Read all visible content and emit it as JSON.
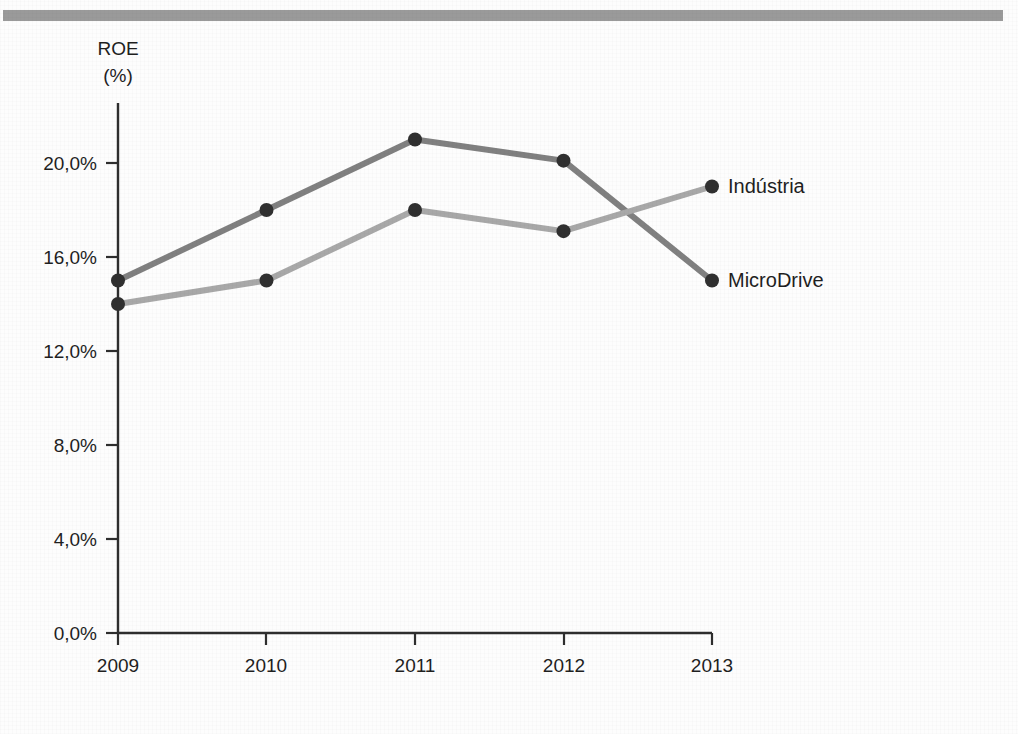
{
  "top_bar": {
    "color": "#9a9a9a"
  },
  "axis_title": {
    "line1": "ROE",
    "line2": "(%)"
  },
  "chart_data": {
    "type": "line",
    "title": "",
    "subtitle": "",
    "xlabel": "",
    "ylabel": "ROE (%)",
    "categories": [
      "2009",
      "2010",
      "2011",
      "2012",
      "2013"
    ],
    "x": [
      2009,
      2010,
      2011,
      2012,
      2013
    ],
    "ytick_labels": [
      "0,0%",
      "4,0%",
      "8,0%",
      "12,0%",
      "16,0%",
      "20,0%"
    ],
    "ytick_values": [
      0,
      4,
      8,
      12,
      16,
      20
    ],
    "ylim": [
      0,
      22.5
    ],
    "grid": false,
    "legend_position": "right-end-of-line",
    "marker_color": "#303030",
    "series": [
      {
        "name": "MicroDrive",
        "label": "MicroDrive",
        "color": "#808080",
        "values": [
          15.0,
          18.0,
          21.0,
          20.1,
          15.0
        ]
      },
      {
        "name": "Indústria",
        "label": "Indústria",
        "color": "#a8a8a8",
        "values": [
          14.0,
          15.0,
          18.0,
          17.1,
          19.0
        ]
      }
    ]
  }
}
